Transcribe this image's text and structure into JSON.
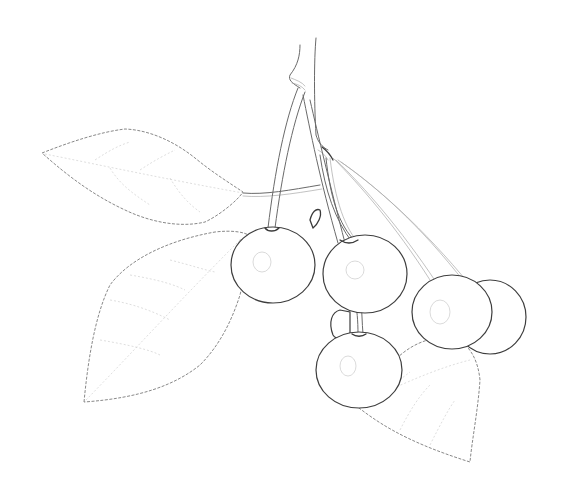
{
  "image": {
    "subject": "pencil sketch of a cherry cluster with leaves",
    "background_color": "#ffffff",
    "line_color": "#4a4a4a",
    "elements": {
      "cherries": 6,
      "leaves": 3,
      "stems": 1
    }
  }
}
